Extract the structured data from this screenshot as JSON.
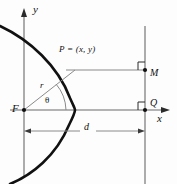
{
  "figure": {
    "type": "geometry-diagram",
    "labels": {
      "y_axis": "y",
      "x_axis": "x",
      "focus": "F",
      "point_P": "P = (x, y)",
      "radius": "r",
      "angle": "θ",
      "point_M": "M",
      "point_Q": "Q",
      "distance": "d"
    },
    "colors": {
      "curve": "#111111",
      "axis": "#4a4a4a",
      "ray": "#6e6e6e",
      "background": "#fdfdfd"
    },
    "geometry": {
      "origin": [
        24,
        110
      ],
      "focus": [
        24,
        110
      ],
      "vertex": [
        75,
        110
      ],
      "directrix_x": 145,
      "point_P": [
        75,
        70
      ],
      "point_M": [
        145,
        70
      ],
      "point_Q": [
        145,
        110
      ],
      "distance_line_y": 131
    }
  }
}
